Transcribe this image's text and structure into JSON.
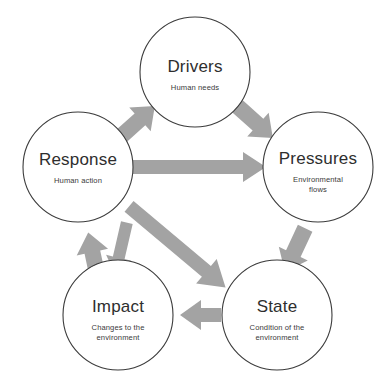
{
  "diagram": {
    "background_color": "#ffffff",
    "circle_stroke_color": "#3b3b3b",
    "arrow_color": "#a3a3a3",
    "text_color": "#2e2e2e",
    "nodes": [
      {
        "id": "drivers",
        "title": "Drivers",
        "subtitle_line1": "Human needs",
        "subtitle_line2": "",
        "cx": 195,
        "cy": 72,
        "r": 55
      },
      {
        "id": "pressures",
        "title": "Pressures",
        "subtitle_line1": "Environmental",
        "subtitle_line2": "flows",
        "cx": 318,
        "cy": 167,
        "r": 55
      },
      {
        "id": "state",
        "title": "State",
        "subtitle_line1": "Condition of the",
        "subtitle_line2": "environment",
        "cx": 277,
        "cy": 315,
        "r": 55
      },
      {
        "id": "impact",
        "title": "Impact",
        "subtitle_line1": "Changes to the",
        "subtitle_line2": "environment",
        "cx": 118,
        "cy": 315,
        "r": 55
      },
      {
        "id": "response",
        "title": "Response",
        "subtitle_line1": "Human action",
        "subtitle_line2": "",
        "cx": 78,
        "cy": 167,
        "r": 55
      }
    ],
    "arrows": [
      {
        "id": "response-to-drivers",
        "from": "response",
        "to": "drivers",
        "label": "Response to Drivers"
      },
      {
        "id": "drivers-to-pressures",
        "from": "drivers",
        "to": "pressures",
        "label": "Drivers to Pressures"
      },
      {
        "id": "response-to-pressures",
        "from": "response",
        "to": "pressures",
        "label": "Response to Pressures"
      },
      {
        "id": "pressures-to-state",
        "from": "pressures",
        "to": "state",
        "label": "Pressures to State"
      },
      {
        "id": "response-to-state",
        "from": "response",
        "to": "state",
        "label": "Response to State"
      },
      {
        "id": "state-to-impact",
        "from": "state",
        "to": "impact",
        "label": "State to Impact"
      },
      {
        "id": "impact-to-response",
        "from": "impact",
        "to": "response",
        "label": "Impact to Response"
      },
      {
        "id": "response-to-impact",
        "from": "response",
        "to": "impact",
        "label": "Response to Impact"
      }
    ]
  }
}
